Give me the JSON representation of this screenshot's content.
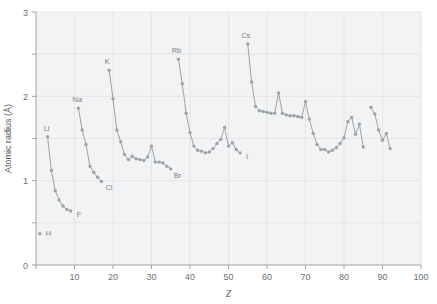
{
  "chart_data": {
    "type": "line",
    "title": "",
    "xlabel": "Z",
    "ylabel": "Atomic radius (Å)",
    "xlim": [
      0,
      100
    ],
    "ylim": [
      0,
      3
    ],
    "xticks": [
      0,
      10,
      20,
      30,
      40,
      50,
      60,
      70,
      80,
      90,
      100
    ],
    "xtick_labels": [
      "",
      "10",
      "20",
      "30",
      "40",
      "50",
      "60",
      "70",
      "80",
      "90",
      "100"
    ],
    "yticks": [
      0,
      0.5,
      1,
      1.5,
      2,
      2.5,
      3
    ],
    "ytick_labels": [
      "0",
      "",
      "1",
      "",
      "2",
      "",
      "3"
    ],
    "grid": true,
    "legend": "none",
    "marker": "circle",
    "line_color": "#9ea3a7",
    "marker_color": "#9ea3a7",
    "background_color": "#f2f3f4",
    "grid_color": "#dfe1e3",
    "axis_color": "#9ea3a7",
    "series": [
      {
        "name": "Hydrogen",
        "x": [
          1
        ],
        "values": [
          0.37
        ]
      },
      {
        "name": "Period 2 (Li-F)",
        "x": [
          3,
          4,
          5,
          6,
          7,
          8,
          9
        ],
        "values": [
          1.52,
          1.12,
          0.88,
          0.77,
          0.7,
          0.66,
          0.64
        ]
      },
      {
        "name": "Period 3 (Na-Cl)",
        "x": [
          11,
          12,
          13,
          14,
          15,
          16,
          17
        ],
        "values": [
          1.86,
          1.6,
          1.43,
          1.17,
          1.1,
          1.04,
          0.99
        ]
      },
      {
        "name": "Period 4 (K-Br)",
        "x": [
          19,
          20,
          21,
          22,
          23,
          24,
          25,
          26,
          27,
          28,
          29,
          30,
          31,
          32,
          33,
          34,
          35
        ],
        "values": [
          2.31,
          1.97,
          1.6,
          1.46,
          1.31,
          1.25,
          1.29,
          1.26,
          1.25,
          1.24,
          1.28,
          1.41,
          1.22,
          1.22,
          1.21,
          1.17,
          1.14
        ]
      },
      {
        "name": "Period 5 (Rb-I)",
        "x": [
          37,
          38,
          39,
          40,
          41,
          42,
          43,
          44,
          45,
          46,
          47,
          48,
          49,
          50,
          51,
          52,
          53
        ],
        "values": [
          2.44,
          2.15,
          1.8,
          1.57,
          1.41,
          1.36,
          1.35,
          1.33,
          1.34,
          1.38,
          1.44,
          1.49,
          1.63,
          1.41,
          1.45,
          1.37,
          1.33
        ]
      },
      {
        "name": "Period 6 (Cs-At)",
        "x": [
          55,
          56,
          57,
          58,
          59,
          60,
          61,
          62,
          63,
          64,
          65,
          66,
          67,
          68,
          69,
          70,
          71,
          72,
          73,
          74,
          75,
          76,
          77,
          78,
          79,
          80,
          81,
          82,
          83,
          84,
          85
        ],
        "values": [
          2.62,
          2.17,
          1.88,
          1.83,
          1.82,
          1.81,
          1.8,
          1.8,
          2.04,
          1.8,
          1.78,
          1.77,
          1.77,
          1.76,
          1.75,
          1.94,
          1.73,
          1.56,
          1.43,
          1.37,
          1.37,
          1.34,
          1.36,
          1.39,
          1.44,
          1.51,
          1.7,
          1.75,
          1.55,
          1.67,
          1.4
        ]
      },
      {
        "name": "Period 7 (Fr-U)",
        "x": [
          87,
          88,
          89,
          90,
          91,
          92
        ],
        "values": [
          1.87,
          1.79,
          1.6,
          1.48,
          1.56,
          1.38
        ]
      }
    ],
    "annotations": [
      {
        "label": "H",
        "x": 1,
        "y": 0.37
      },
      {
        "label": "Li",
        "x": 3,
        "y": 1.52
      },
      {
        "label": "F",
        "x": 9,
        "y": 0.64
      },
      {
        "label": "Na",
        "x": 11,
        "y": 1.86
      },
      {
        "label": "Cl",
        "x": 17,
        "y": 0.99
      },
      {
        "label": "K",
        "x": 19,
        "y": 2.31
      },
      {
        "label": "Br",
        "x": 35,
        "y": 1.14
      },
      {
        "label": "Rb",
        "x": 37,
        "y": 2.44
      },
      {
        "label": "I",
        "x": 53,
        "y": 1.33
      },
      {
        "label": "Cs",
        "x": 55,
        "y": 2.62
      }
    ]
  }
}
